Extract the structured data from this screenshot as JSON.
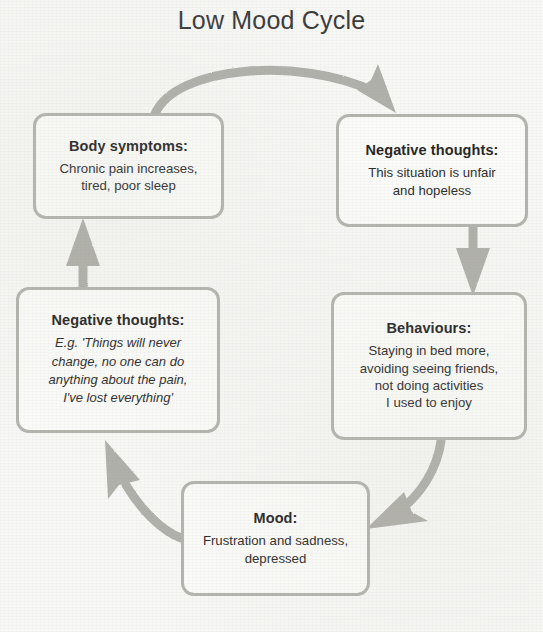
{
  "diagram": {
    "title": "Low Mood Cycle",
    "type": "cycle-diagram",
    "background_color": "#f7f7f5",
    "box_border_color": "#b4b4ae",
    "arrow_color": "#b0b0aa",
    "text_color": "#2c2c2c",
    "nodes": [
      {
        "id": "body-symptoms",
        "title": "Body symptoms:",
        "body": "Chronic pain increases,\ntired, poor sleep",
        "italic": false
      },
      {
        "id": "negative-thoughts-top",
        "title": "Negative thoughts:",
        "body": "This situation is unfair\nand hopeless",
        "italic": false
      },
      {
        "id": "behaviours",
        "title": "Behaviours:",
        "body": "Staying in bed more,\navoiding seeing friends,\nnot doing activities\nI used to enjoy",
        "italic": false
      },
      {
        "id": "mood",
        "title": "Mood:",
        "body": "Frustration and sadness,\ndepressed",
        "italic": false
      },
      {
        "id": "negative-thoughts-left",
        "title": "Negative thoughts:",
        "body": "E.g. 'Things will never\nchange, no one can do\nanything about the pain,\nI've lost everything'",
        "italic": true
      }
    ],
    "arrows": [
      {
        "id": "body-symptoms-to-negative-thoughts",
        "from": "body-symptoms",
        "to": "negative-thoughts-top",
        "shape": "curve-over-top"
      },
      {
        "id": "negative-thoughts-to-behaviours",
        "from": "negative-thoughts-top",
        "to": "behaviours",
        "shape": "straight-down"
      },
      {
        "id": "behaviours-to-mood",
        "from": "behaviours",
        "to": "mood",
        "shape": "curve-down-left"
      },
      {
        "id": "mood-to-negative-thoughts-left",
        "from": "mood",
        "to": "negative-thoughts-left",
        "shape": "curve-up-left"
      },
      {
        "id": "negative-thoughts-left-to-body-symptoms",
        "from": "negative-thoughts-left",
        "to": "body-symptoms",
        "shape": "straight-up"
      }
    ]
  }
}
